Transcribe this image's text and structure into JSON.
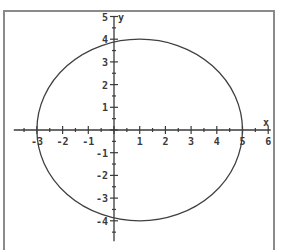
{
  "chart_data": {
    "type": "line",
    "title": "",
    "xlabel": "x",
    "ylabel": "y",
    "xlim": [
      -3.9,
      6.1
    ],
    "ylim": [
      -4.9,
      5
    ],
    "grid": false,
    "x_ticks": [
      -3,
      -2,
      -1,
      1,
      2,
      3,
      4,
      5,
      6
    ],
    "y_ticks": [
      5,
      4,
      3,
      2,
      1,
      -1,
      -2,
      -3,
      -4
    ],
    "x_tick_labels": [
      "-3",
      "-2",
      "-1",
      "1",
      "2",
      "3",
      "4",
      "5",
      "6"
    ],
    "y_tick_labels": [
      "5",
      "4",
      "3",
      "2",
      "1",
      "-1",
      "-2",
      "-3",
      "-4"
    ],
    "series": [
      {
        "name": "ellipse",
        "shape": "ellipse",
        "center": [
          1,
          0
        ],
        "semi_axis_x": 4,
        "semi_axis_y": 4,
        "extents": {
          "x_min": -3,
          "x_max": 5,
          "y_min": -4,
          "y_max": 4
        },
        "color": "#404040"
      }
    ]
  },
  "axes": {
    "x_label": "x",
    "y_label": "y",
    "color": "#3a3a3a"
  }
}
